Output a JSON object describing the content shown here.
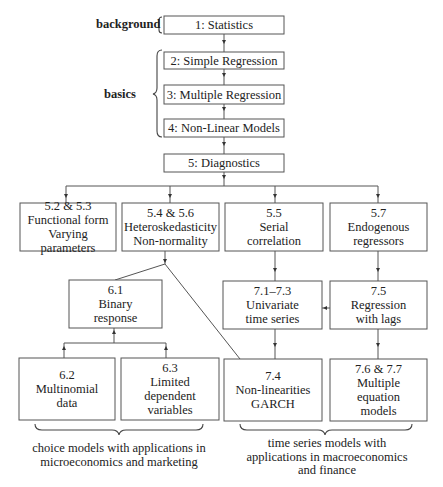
{
  "side_labels": {
    "background": "background",
    "basics": "basics"
  },
  "nodes": {
    "n1": {
      "lines": [
        "1: Statistics"
      ]
    },
    "n2": {
      "lines": [
        "2: Simple Regression"
      ]
    },
    "n3": {
      "lines": [
        "3: Multiple Regression"
      ]
    },
    "n4": {
      "lines": [
        "4: Non-Linear Models"
      ]
    },
    "n5": {
      "lines": [
        "5: Diagnostics"
      ]
    },
    "n52": {
      "lines": [
        "5.2 & 5.3",
        "Functional form",
        "Varying parameters"
      ]
    },
    "n54": {
      "lines": [
        "5.4 & 5.6",
        "Heteroskedasticity",
        "Non-normality"
      ]
    },
    "n55": {
      "lines": [
        "5.5",
        "Serial",
        "correlation"
      ]
    },
    "n57": {
      "lines": [
        "5.7",
        "Endogenous",
        "regressors"
      ]
    },
    "n61": {
      "lines": [
        "6.1",
        "Binary",
        "response"
      ]
    },
    "n71": {
      "lines": [
        "7.1–7.3",
        "Univariate",
        "time series"
      ]
    },
    "n75": {
      "lines": [
        "7.5",
        "Regression",
        "with lags"
      ]
    },
    "n62": {
      "lines": [
        "6.2",
        "Multinomial",
        "data"
      ]
    },
    "n63": {
      "lines": [
        "6.3",
        "Limited",
        "dependent",
        "variables"
      ]
    },
    "n74": {
      "lines": [
        "7.4",
        "Non-linearities",
        "GARCH"
      ]
    },
    "n76": {
      "lines": [
        "7.6 & 7.7",
        "Multiple",
        "equation",
        "models"
      ]
    }
  },
  "captions": {
    "choice": [
      "choice models with applications in",
      "microeconomics and marketing"
    ],
    "timeseries": [
      "time series models with",
      "applications in macroeconomics",
      "and finance"
    ]
  },
  "edges": [
    [
      "n1",
      "n2"
    ],
    [
      "n2",
      "n3"
    ],
    [
      "n3",
      "n4"
    ],
    [
      "n4",
      "n5"
    ],
    [
      "n5",
      "n52"
    ],
    [
      "n5",
      "n54"
    ],
    [
      "n5",
      "n55"
    ],
    [
      "n5",
      "n57"
    ],
    [
      "n54",
      "n61"
    ],
    [
      "n54",
      "n74"
    ],
    [
      "n55",
      "n71"
    ],
    [
      "n57",
      "n75"
    ],
    [
      "n75",
      "n71"
    ],
    [
      "n61",
      "n62"
    ],
    [
      "n61",
      "n63"
    ],
    [
      "n71",
      "n74"
    ],
    [
      "n75",
      "n76"
    ]
  ]
}
